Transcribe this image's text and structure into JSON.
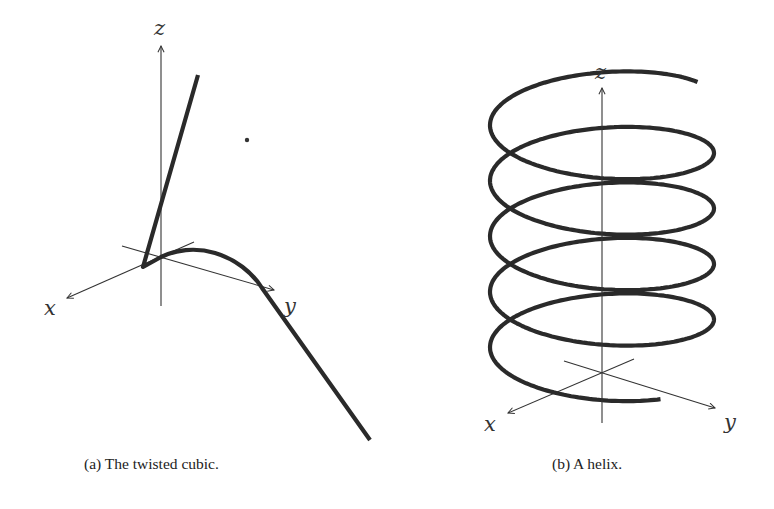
{
  "figures": [
    {
      "id": "a",
      "caption": "(a) The twisted cubic.",
      "axis_labels": {
        "x": "x",
        "y": "y",
        "z": "z"
      },
      "curve": "twisted cubic",
      "stray_point": true
    },
    {
      "id": "b",
      "caption": "(b) A helix.",
      "axis_labels": {
        "x": "x",
        "y": "y",
        "z": "z"
      },
      "curve": "helix",
      "turns": 4.75
    }
  ],
  "colors": {
    "curve": "#2a2a2a",
    "axis": "#333333",
    "background": "#ffffff"
  }
}
